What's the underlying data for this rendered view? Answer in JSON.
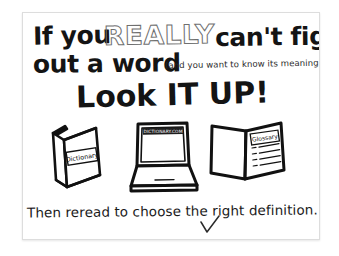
{
  "poster": {
    "headline": {
      "part1": "If you",
      "emphasis": "REALLY",
      "part2": "can't figure",
      "part3": "out a word",
      "parenthetical": "(and you want to know its meaning)",
      "call_to_action": "Look IT UP!"
    },
    "illustrations": [
      {
        "name": "closed-dictionary-book",
        "label": "Dictionary"
      },
      {
        "name": "laptop-computer",
        "label": "DICTIONARY.COM"
      },
      {
        "name": "open-glossary-book",
        "label": "Glossary"
      }
    ],
    "footer": {
      "text": "Then reread to choose the right definition.",
      "check_mark": "checkmark"
    }
  },
  "colors": {
    "ink": "#141414",
    "outline_ink": "#6f6f6f",
    "card_background": "#ffffff",
    "card_border": "#dddddd",
    "page_background": "#ffffff"
  }
}
